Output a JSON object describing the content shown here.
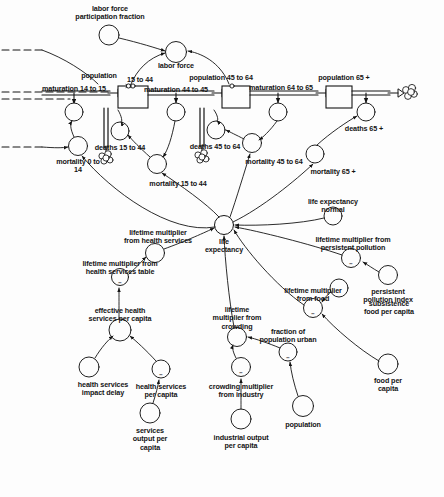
{
  "diagram": {
    "type": "system-dynamics-stock-and-flow",
    "ink_color": "#141414",
    "background_color": "#fdfdfd",
    "stocks": [
      {
        "id": "pop_15_44",
        "label": "population\n15 to 44",
        "x": 130,
        "y": 97
      },
      {
        "id": "pop_45_64",
        "label": "population 45 to 64",
        "x": 228,
        "y": 97
      },
      {
        "id": "pop_65",
        "label": "population 65 +",
        "x": 336,
        "y": 97
      }
    ],
    "flows": [
      {
        "id": "mat_14_15",
        "label": "maturation 14 to 15"
      },
      {
        "id": "mat_44_45",
        "label": "maturation 44 to 45"
      },
      {
        "id": "mat_64_65",
        "label": "maturation 64 to 65"
      },
      {
        "id": "deaths_15_44",
        "label": "deaths 15 to 44"
      },
      {
        "id": "deaths_45_64",
        "label": "deaths 45 to 64"
      },
      {
        "id": "deaths_65",
        "label": "deaths 65 +"
      }
    ],
    "variables": [
      {
        "id": "lf_part_frac",
        "label": "labor force\nparticipation fraction"
      },
      {
        "id": "labor_force",
        "label": "labor force"
      },
      {
        "id": "mortality_0_14",
        "label": "mortality 0 to\n14"
      },
      {
        "id": "mortality_15_44",
        "label": "mortality 15 to 44"
      },
      {
        "id": "mortality_45_64",
        "label": "mortality 45 to 64"
      },
      {
        "id": "mortality_65",
        "label": "mortality 65 +"
      },
      {
        "id": "life_expectancy",
        "label": "life\nexpectancy"
      },
      {
        "id": "le_normal",
        "label": "life expectancy\nnormal"
      },
      {
        "id": "lm_health_services",
        "label": "lifetime multiplier\nfrom health services"
      },
      {
        "id": "lm_health_services_table",
        "label": "lifetime multiplier from\nhealth services table"
      },
      {
        "id": "eff_health_pc",
        "label": "effective health\nservices per capita"
      },
      {
        "id": "health_impact_delay",
        "label": "health services\nimpact delay"
      },
      {
        "id": "health_services_pc",
        "label": "health services\nper capita"
      },
      {
        "id": "services_output_pc",
        "label": "services\noutput per\ncapita"
      },
      {
        "id": "lm_crowding",
        "label": "lifetime\nmultiplier from\ncrowding"
      },
      {
        "id": "crowding_industry",
        "label": "crowding multiplier\nfrom industry"
      },
      {
        "id": "industrial_output_pc",
        "label": "industrial output\nper capita"
      },
      {
        "id": "frac_pop_urban",
        "label": "fraction of\npopulation urban"
      },
      {
        "id": "population",
        "label": "population"
      },
      {
        "id": "lm_pollution",
        "label": "lifetime multiplier from\npersistent pollution"
      },
      {
        "id": "pollution_index",
        "label": "persistent\npollution index"
      },
      {
        "id": "lm_food",
        "label": "lifetime multiplier\nfrom food"
      },
      {
        "id": "subsistence_food_pc",
        "label": "subsistence\nfood per capita"
      },
      {
        "id": "food_pc",
        "label": "food per\ncapita"
      }
    ],
    "labels": [
      {
        "id": "l_lf_part_frac",
        "text": "labor force\nparticipation fraction",
        "x": 110,
        "y": 5,
        "align": "center"
      },
      {
        "id": "l_labor_force",
        "text": "labor force",
        "x": 176,
        "y": 62,
        "align": "center"
      },
      {
        "id": "l_pop_15_44",
        "text": "population",
        "x": 99,
        "y": 72,
        "align": "center"
      },
      {
        "id": "l_pop_15_44_b",
        "text": "15 to 44",
        "x": 140,
        "y": 76,
        "align": "center"
      },
      {
        "id": "l_mat_14_15",
        "text": "maturation 14 to 15",
        "x": 74,
        "y": 85,
        "align": "center"
      },
      {
        "id": "l_mat_44_45",
        "text": "maturation 44 to 45",
        "x": 176,
        "y": 86,
        "align": "center"
      },
      {
        "id": "l_pop_45_64",
        "text": "population 45 to 64",
        "x": 221,
        "y": 74,
        "align": "center"
      },
      {
        "id": "l_mat_64_65",
        "text": "maturation 64 to 65",
        "x": 281,
        "y": 84,
        "align": "center"
      },
      {
        "id": "l_pop_65",
        "text": "population 65 +",
        "x": 344,
        "y": 74,
        "align": "center"
      },
      {
        "id": "l_deaths_65",
        "text": "deaths 65 +",
        "x": 364,
        "y": 119,
        "align": "center"
      },
      {
        "id": "l_mortality_65",
        "text": "mortality 65 +",
        "x": 333,
        "y": 168,
        "align": "center"
      },
      {
        "id": "l_deaths_15_44",
        "text": "deaths 15 to 44",
        "x": 120,
        "y": 144,
        "align": "center"
      },
      {
        "id": "l_deaths_45_64",
        "text": "deaths 45 to 64",
        "x": 215,
        "y": 143,
        "align": "center"
      },
      {
        "id": "l_mortality_0_14",
        "text": "mortality 0 to\n14",
        "x": 78,
        "y": 160,
        "align": "center"
      },
      {
        "id": "l_mortality_15_44",
        "text": "mortality 15 to 44",
        "x": 178,
        "y": 178,
        "align": "center"
      },
      {
        "id": "l_mortality_45_64",
        "text": "mortality 45 to 64",
        "x": 274,
        "y": 158,
        "align": "center"
      },
      {
        "id": "l_le_normal",
        "text": "life expectancy\nnormal",
        "x": 333,
        "y": 202,
        "align": "center"
      },
      {
        "id": "l_lm_health_services",
        "text": "lifetime multiplier\nfrom health services",
        "x": 158,
        "y": 229,
        "align": "center"
      },
      {
        "id": "l_life_expectancy",
        "text": "life\nexpectancy",
        "x": 224,
        "y": 238,
        "align": "center"
      },
      {
        "id": "l_lm_pollution",
        "text": "lifetime multiplier from\npersistent pollution",
        "x": 353,
        "y": 245,
        "align": "center"
      },
      {
        "id": "l_lm_health_table",
        "text": "lifetime multiplier from\nhealth services table",
        "x": 120,
        "y": 265,
        "align": "center"
      },
      {
        "id": "l_pollution_index",
        "text": "persistent\npollution index",
        "x": 388,
        "y": 288,
        "align": "center"
      },
      {
        "id": "l_lm_food",
        "text": "lifetime multiplier\nfrom food",
        "x": 313,
        "y": 294,
        "align": "center"
      },
      {
        "id": "l_eff_health_pc",
        "text": "effective health\nservices per capita",
        "x": 120,
        "y": 307,
        "align": "center"
      },
      {
        "id": "l_lm_crowding",
        "text": "lifetime\nmultiplier from\ncrowding",
        "x": 237,
        "y": 312,
        "align": "center"
      },
      {
        "id": "l_subsistence_food",
        "text": "subsistence\nfood per capita",
        "x": 389,
        "y": 330,
        "align": "center"
      },
      {
        "id": "l_frac_pop_urban",
        "text": "fraction of\npopulation urban",
        "x": 288,
        "y": 338,
        "align": "center"
      },
      {
        "id": "l_food_pc",
        "text": "food per\ncapita",
        "x": 388,
        "y": 380,
        "align": "center"
      },
      {
        "id": "l_health_impact_delay",
        "text": "health services\nimpact delay",
        "x": 103,
        "y": 383,
        "align": "center"
      },
      {
        "id": "l_health_services_pc",
        "text": "health services\nper capita",
        "x": 161,
        "y": 396,
        "align": "center"
      },
      {
        "id": "l_crowding_industry",
        "text": "crowding multiplier\nfrom industry",
        "x": 241,
        "y": 394,
        "align": "center"
      },
      {
        "id": "l_population",
        "text": "population",
        "x": 303,
        "y": 424,
        "align": "center"
      },
      {
        "id": "l_services_output_pc",
        "text": "services\noutput per\ncapita",
        "x": 150,
        "y": 436,
        "align": "center"
      },
      {
        "id": "l_industrial_output_pc",
        "text": "industrial output\nper capita",
        "x": 241,
        "y": 449,
        "align": "center"
      }
    ],
    "polarity_marks": [
      {
        "id": "s_lm_health_table",
        "text": "−",
        "x": 120,
        "y": 283
      },
      {
        "id": "s_health_pc",
        "text": "−",
        "x": 161,
        "y": 376
      },
      {
        "id": "s_lm_pollution",
        "text": "−",
        "x": 351,
        "y": 264
      },
      {
        "id": "s_lm_food",
        "text": "−",
        "x": 313,
        "y": 314
      },
      {
        "id": "s_frac_urban",
        "text": "−",
        "x": 288,
        "y": 358
      },
      {
        "id": "s_crowding_ind",
        "text": "−",
        "x": 241,
        "y": 374
      }
    ]
  }
}
